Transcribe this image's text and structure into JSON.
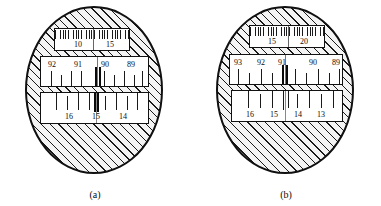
{
  "figure_caption_a": "(a)",
  "figure_caption_b": "(b)",
  "colors": {
    "outline": "#101010",
    "hatch": "#1a1a1a",
    "window_fill": "#ffffff",
    "disc_fill": "#f4f4f4"
  },
  "figures": [
    {
      "id": "a",
      "caption": "(a)",
      "windows": [
        {
          "name": "top-fine-scale-window",
          "type": "fine",
          "labels": [
            {
              "text": "10",
              "x_pct": 30
            },
            {
              "text": "15",
              "x_pct": 72
            }
          ],
          "index_line_x_pct": 51
        },
        {
          "name": "middle-scale-window",
          "type": "coarse-top-labels",
          "labels": [
            {
              "text": "92",
              "x_pct": 9
            },
            {
              "text": "91",
              "x_pct": 33
            },
            {
              "text": "90",
              "x_pct": 57
            },
            {
              "text": "89",
              "x_pct": 82
            }
          ],
          "ticks_pct": [
            9,
            18,
            27,
            36,
            51,
            54,
            57,
            66,
            75,
            84,
            93
          ],
          "bold_ticks_pct": [
            51,
            54
          ],
          "index_line_x_pct": 52
        },
        {
          "name": "bottom-scale-window",
          "type": "coarse-bottom-labels",
          "labels": [
            {
              "text": "16",
              "x_pct": 24
            },
            {
              "text": "15",
              "x_pct": 49
            },
            {
              "text": "14",
              "x_pct": 74
            }
          ],
          "ticks_pct": [
            14,
            24,
            34,
            44,
            49,
            51,
            59,
            69,
            79,
            89
          ],
          "bold_ticks_pct": [
            49,
            51
          ],
          "index_line_x_pct": 50
        }
      ]
    },
    {
      "id": "b",
      "caption": "(b)",
      "windows": [
        {
          "name": "top-fine-scale-window",
          "type": "fine",
          "labels": [
            {
              "text": "15",
              "x_pct": 29
            },
            {
              "text": "20",
              "x_pct": 71
            }
          ],
          "index_line_x_pct": 50
        },
        {
          "name": "middle-scale-window",
          "type": "coarse-top-labels",
          "labels": [
            {
              "text": "93",
              "x_pct": 5
            },
            {
              "text": "92",
              "x_pct": 26
            },
            {
              "text": "91",
              "x_pct": 45
            },
            {
              "text": "90",
              "x_pct": 72
            },
            {
              "text": "89",
              "x_pct": 92
            }
          ],
          "ticks_pct": [
            7,
            17,
            27,
            37,
            46,
            49,
            57,
            67,
            77,
            87,
            96
          ],
          "bold_ticks_pct": [
            46,
            49
          ],
          "index_line_x_pct": 48
        },
        {
          "name": "bottom-scale-window",
          "type": "coarse-bottom-labels",
          "labels": [
            {
              "text": "16",
              "x_pct": 14
            },
            {
              "text": "15",
              "x_pct": 36
            },
            {
              "text": "14",
              "x_pct": 58
            },
            {
              "text": "13",
              "x_pct": 79
            }
          ],
          "ticks_pct": [
            14,
            25,
            36,
            46,
            50,
            58,
            68,
            79,
            90
          ],
          "bold_ticks_pct": [
            46
          ],
          "index_line_x_pct": 48
        }
      ]
    }
  ]
}
